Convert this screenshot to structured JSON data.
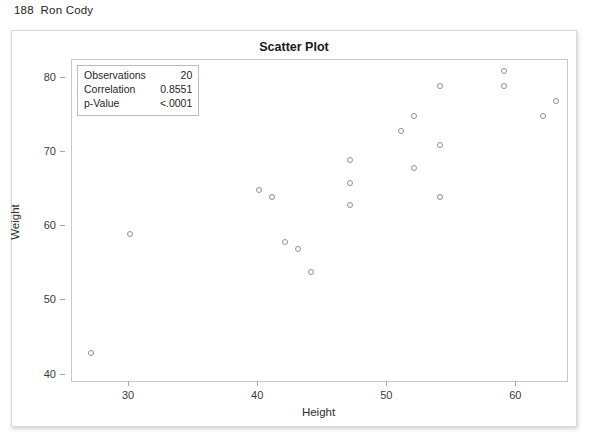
{
  "page": {
    "header": "188  Ron Cody"
  },
  "chart_data": {
    "type": "scatter",
    "title": "Scatter Plot",
    "xlabel": "Height",
    "ylabel": "Weight",
    "xlim": [
      25.5,
      64.0
    ],
    "ylim": [
      39.0,
      82.5
    ],
    "xticks": [
      30,
      40,
      50,
      60
    ],
    "yticks": [
      40,
      50,
      60,
      70,
      80
    ],
    "grid": false,
    "marker": "open-circle",
    "marker_color": "#8e8e96",
    "series": [
      {
        "name": "Height vs Weight",
        "x": [
          27,
          30,
          40,
          41,
          42,
          43,
          44,
          47,
          47,
          47,
          51,
          52,
          52,
          54,
          54,
          54,
          59,
          59,
          62,
          63
        ],
        "y": [
          43,
          59,
          65,
          64,
          58,
          57,
          54,
          69,
          66,
          63,
          73,
          75,
          68,
          79,
          71,
          64,
          81,
          79,
          75,
          77
        ]
      }
    ],
    "stats": {
      "rows": [
        {
          "label": "Observations",
          "value": "20"
        },
        {
          "label": "Correlation",
          "value": "0.8551"
        },
        {
          "label": "p-Value",
          "value": "<.0001"
        }
      ]
    }
  }
}
